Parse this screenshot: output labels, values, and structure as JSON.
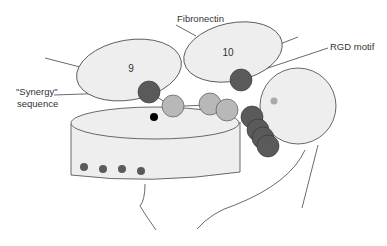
{
  "labels": {
    "fibronectin": "Fibronectin",
    "rgd_motif": "RGD motif",
    "synergy_line1": "\"Synergy\"",
    "synergy_line2": "sequence",
    "domain9": "9",
    "domain10": "10"
  },
  "colors": {
    "domain_fill": "#eeeeee",
    "outline": "#444444",
    "dark_bead": "#5a5a5a",
    "light_bead": "#b8b8b8",
    "black_dot": "#000000",
    "mid_dot": "#aaaaaa"
  }
}
